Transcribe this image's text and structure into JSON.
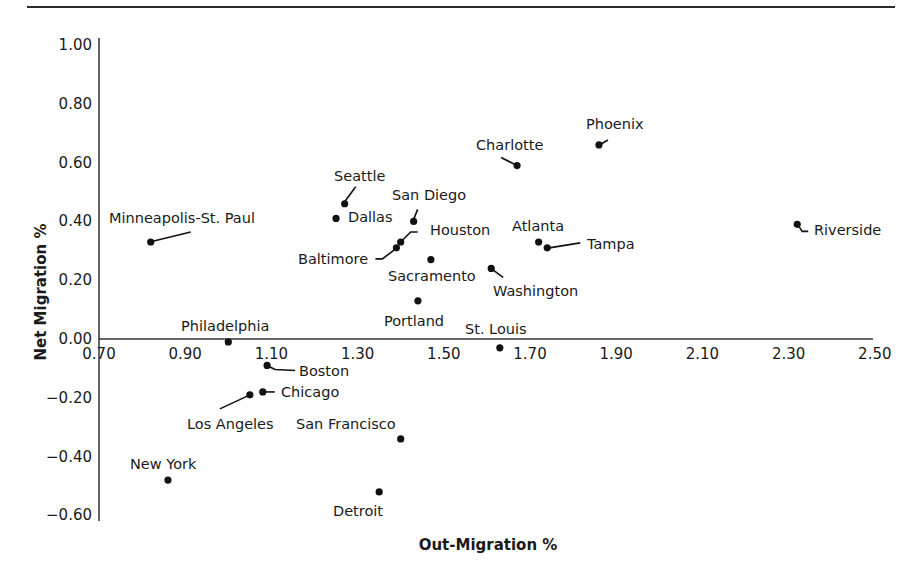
{
  "chart_data": {
    "type": "scatter",
    "title": "",
    "xlabel": "Out-Migration %",
    "ylabel": "Net Migration %",
    "xlim": [
      0.7,
      2.5
    ],
    "ylim": [
      -0.6,
      1.0
    ],
    "x_ticks": [
      "0.70",
      "0.90",
      "1.10",
      "1.30",
      "1.50",
      "1.70",
      "1.90",
      "2.10",
      "2.30",
      "2.50"
    ],
    "y_ticks": [
      "1.00",
      "0.80",
      "0.60",
      "0.40",
      "0.20",
      "0.00",
      "-0.20",
      "-0.40",
      "-0.60"
    ],
    "grid": false,
    "legend": null,
    "points": [
      {
        "label": "Minneapolis-St. Paul",
        "x": 0.82,
        "y": 0.33
      },
      {
        "label": "Seattle",
        "x": 1.27,
        "y": 0.46
      },
      {
        "label": "Dallas",
        "x": 1.25,
        "y": 0.41
      },
      {
        "label": "San Diego",
        "x": 1.43,
        "y": 0.4
      },
      {
        "label": "Houston",
        "x": 1.4,
        "y": 0.33
      },
      {
        "label": "Baltimore",
        "x": 1.39,
        "y": 0.31
      },
      {
        "label": "Sacramento",
        "x": 1.47,
        "y": 0.27
      },
      {
        "label": "Portland",
        "x": 1.44,
        "y": 0.13
      },
      {
        "label": "Washington",
        "x": 1.61,
        "y": 0.24
      },
      {
        "label": "Charlotte",
        "x": 1.67,
        "y": 0.59
      },
      {
        "label": "Phoenix",
        "x": 1.86,
        "y": 0.66
      },
      {
        "label": "Atlanta",
        "x": 1.72,
        "y": 0.33
      },
      {
        "label": "Tampa",
        "x": 1.74,
        "y": 0.31
      },
      {
        "label": "Riverside",
        "x": 2.32,
        "y": 0.39
      },
      {
        "label": "Philadelphia",
        "x": 1.0,
        "y": -0.01
      },
      {
        "label": "St. Louis",
        "x": 1.63,
        "y": -0.03
      },
      {
        "label": "Boston",
        "x": 1.09,
        "y": -0.09
      },
      {
        "label": "Chicago",
        "x": 1.08,
        "y": -0.18
      },
      {
        "label": "Los Angeles",
        "x": 1.05,
        "y": -0.19
      },
      {
        "label": "San Francisco",
        "x": 1.4,
        "y": -0.34
      },
      {
        "label": "New York",
        "x": 0.86,
        "y": -0.48
      },
      {
        "label": "Detroit",
        "x": 1.35,
        "y": -0.52
      }
    ]
  },
  "axes": {
    "x_title": "Out-Migration %",
    "y_title": "Net Migration %"
  }
}
